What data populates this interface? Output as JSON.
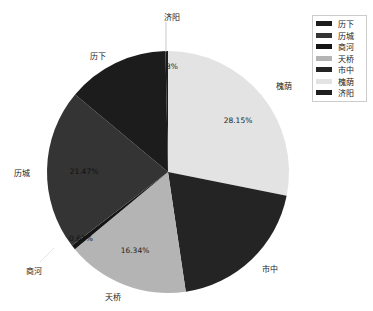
{
  "chart_data": {
    "type": "pie",
    "title": "",
    "categories": [
      "历下",
      "历城",
      "商河",
      "天桥",
      "市中",
      "槐荫",
      "济阳"
    ],
    "values": [
      13.6,
      21.47,
      0.61,
      16.34,
      19.5,
      28.15,
      0.33
    ],
    "value_labels": [
      "",
      "21.47%",
      "0.61%",
      "16.34%",
      "",
      "28.15%",
      "0.33%"
    ],
    "colors": [
      "#1c1c1c",
      "#343434",
      "#151515",
      "#b4b4b4",
      "#242424",
      "#e3e3e3",
      "#1e1e1e"
    ],
    "start_angle": 90,
    "direction": "clockwise_from_top_for_槐荫",
    "legend_position": "upper right"
  },
  "legend": {
    "items": [
      {
        "label": "历下",
        "color": "#1c1c1c"
      },
      {
        "label": "历城",
        "color": "#343434"
      },
      {
        "label": "商河",
        "color": "#151515"
      },
      {
        "label": "天桥",
        "color": "#b4b4b4"
      },
      {
        "label": "市中",
        "color": "#242424"
      },
      {
        "label": "槐荫",
        "color": "#e3e3e3"
      },
      {
        "label": "济阳",
        "color": "#1e1e1e"
      }
    ]
  },
  "labels": {
    "lixia": "历下",
    "licheng": "历城",
    "shanghe": "商河",
    "tianqiao": "天桥",
    "shizhong": "市中",
    "huaiyin": "槐荫",
    "jiyang": "济阳"
  },
  "pcts": {
    "huaiyin": "28.15%",
    "tianqiao": "16.34%",
    "licheng": "21.47%",
    "shanghe": "0.61%",
    "jiyang": "3%"
  }
}
